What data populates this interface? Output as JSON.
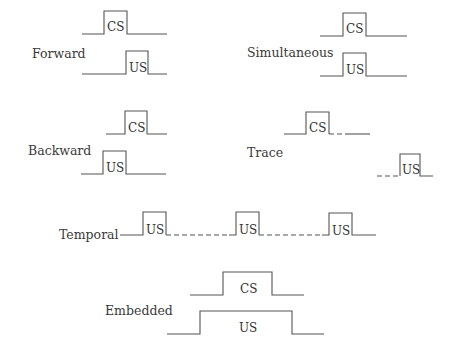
{
  "diagram": {
    "panels": [
      {
        "id": "forward",
        "label": "Forward",
        "signals": [
          {
            "name": "CS"
          },
          {
            "name": "US"
          }
        ]
      },
      {
        "id": "simultaneous",
        "label": "Simultaneous",
        "signals": [
          {
            "name": "CS"
          },
          {
            "name": "US"
          }
        ]
      },
      {
        "id": "backward",
        "label": "Backward",
        "signals": [
          {
            "name": "CS"
          },
          {
            "name": "US"
          }
        ]
      },
      {
        "id": "trace",
        "label": "Trace",
        "signals": [
          {
            "name": "CS"
          },
          {
            "name": "US"
          }
        ]
      },
      {
        "id": "temporal",
        "label": "Temporal",
        "signals": [
          {
            "name": "US"
          },
          {
            "name": "US"
          },
          {
            "name": "US"
          }
        ]
      },
      {
        "id": "embedded",
        "label": "Embedded",
        "signals": [
          {
            "name": "CS"
          },
          {
            "name": "US"
          }
        ]
      }
    ]
  }
}
